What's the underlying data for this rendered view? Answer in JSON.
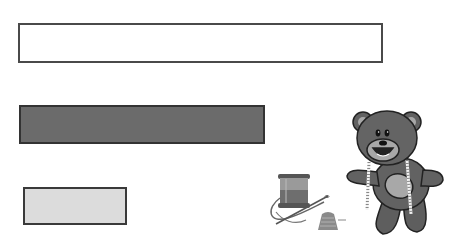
{
  "worksheet": {
    "bars": [
      {
        "id": "bar-1",
        "fill": "#ffffff",
        "length_rank": "long"
      },
      {
        "id": "bar-2",
        "fill": "#6b6b6b",
        "length_rank": "medium"
      },
      {
        "id": "bar-3",
        "fill": "#dcdcdc",
        "length_rank": "short"
      }
    ],
    "images": [
      {
        "name": "sewing-kit",
        "depicts": "spool of thread, needle and thimble"
      },
      {
        "name": "teddy-bear",
        "depicts": "teddy bear with measuring tape around neck"
      }
    ]
  }
}
